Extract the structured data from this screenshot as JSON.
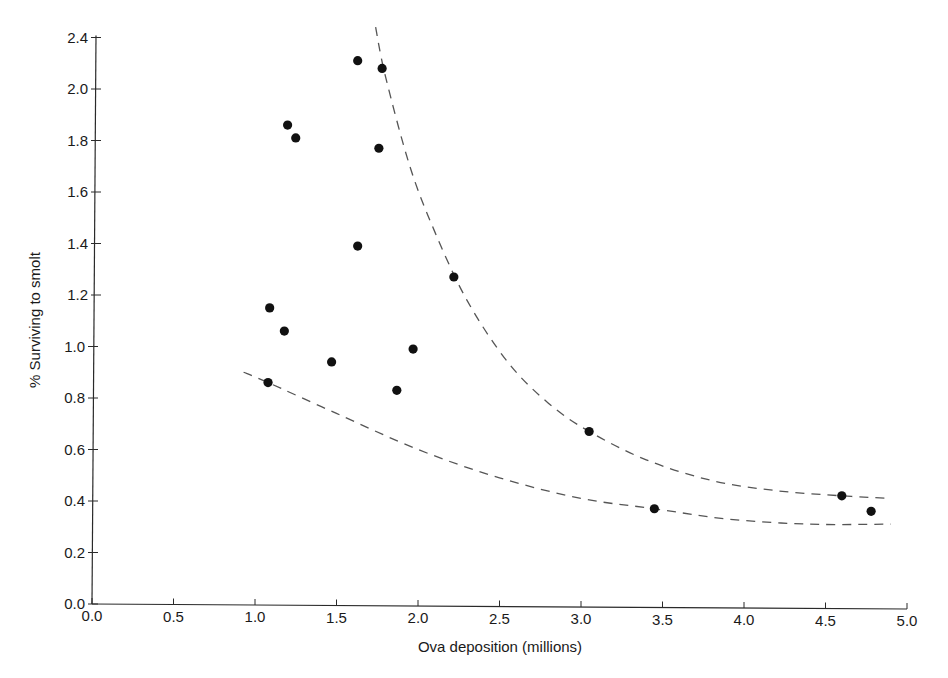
{
  "chart_data": {
    "type": "scatter",
    "title": "",
    "xlabel": "Ova deposition (millions)",
    "ylabel": "% Surviving to smolt",
    "xlim": [
      0.0,
      5.0
    ],
    "ylim": [
      0.0,
      2.2
    ],
    "x_ticks": [
      "0.0",
      "0.5",
      "1.0",
      "1.5",
      "2.0",
      "2.5",
      "3.0",
      "3.5",
      "4.0",
      "4.5",
      "5.0"
    ],
    "y_ticks": [
      {
        "value": 0.0,
        "label": "0.0"
      },
      {
        "value": 0.2,
        "label": "0.2"
      },
      {
        "value": 0.4,
        "label": "0.4"
      },
      {
        "value": 0.6,
        "label": "0.6"
      },
      {
        "value": 0.8,
        "label": "0.8"
      },
      {
        "value": 1.0,
        "label": "1.0"
      },
      {
        "value": 1.2,
        "label": "1.2"
      },
      {
        "value": 1.4,
        "label": "1.4"
      },
      {
        "value": 1.6,
        "label": "1.6"
      },
      {
        "value": 1.8,
        "label": "1.8"
      },
      {
        "value": 2.0,
        "label": "2.0"
      },
      {
        "value": 2.2,
        "label": "2.4"
      }
    ],
    "grid": false,
    "legend": null,
    "series": [
      {
        "name": "Observations",
        "marker": "filled-circle",
        "points": [
          {
            "x": 1.63,
            "y": 2.11
          },
          {
            "x": 1.78,
            "y": 2.08
          },
          {
            "x": 1.2,
            "y": 1.86
          },
          {
            "x": 1.25,
            "y": 1.81
          },
          {
            "x": 1.76,
            "y": 1.77
          },
          {
            "x": 1.63,
            "y": 1.39
          },
          {
            "x": 2.22,
            "y": 1.27
          },
          {
            "x": 1.09,
            "y": 1.15
          },
          {
            "x": 1.18,
            "y": 1.06
          },
          {
            "x": 1.97,
            "y": 0.99
          },
          {
            "x": 1.47,
            "y": 0.94
          },
          {
            "x": 1.08,
            "y": 0.86
          },
          {
            "x": 1.87,
            "y": 0.83
          },
          {
            "x": 3.05,
            "y": 0.67
          },
          {
            "x": 3.45,
            "y": 0.37
          },
          {
            "x": 4.6,
            "y": 0.42
          },
          {
            "x": 4.78,
            "y": 0.36
          }
        ]
      },
      {
        "name": "Upper bound curve",
        "style": "dashed",
        "points": [
          {
            "x": 1.74,
            "y": 2.24
          },
          {
            "x": 1.8,
            "y": 2.05
          },
          {
            "x": 1.95,
            "y": 1.7
          },
          {
            "x": 2.1,
            "y": 1.45
          },
          {
            "x": 2.3,
            "y": 1.18
          },
          {
            "x": 2.55,
            "y": 0.94
          },
          {
            "x": 2.8,
            "y": 0.78
          },
          {
            "x": 3.05,
            "y": 0.67
          },
          {
            "x": 3.4,
            "y": 0.56
          },
          {
            "x": 3.8,
            "y": 0.48
          },
          {
            "x": 4.2,
            "y": 0.44
          },
          {
            "x": 4.6,
            "y": 0.42
          },
          {
            "x": 4.9,
            "y": 0.41
          }
        ]
      },
      {
        "name": "Lower bound curve",
        "style": "dashed",
        "points": [
          {
            "x": 0.93,
            "y": 0.9
          },
          {
            "x": 1.08,
            "y": 0.86
          },
          {
            "x": 1.5,
            "y": 0.74
          },
          {
            "x": 2.0,
            "y": 0.6
          },
          {
            "x": 2.5,
            "y": 0.49
          },
          {
            "x": 3.0,
            "y": 0.41
          },
          {
            "x": 3.45,
            "y": 0.37
          },
          {
            "x": 3.9,
            "y": 0.33
          },
          {
            "x": 4.4,
            "y": 0.31
          },
          {
            "x": 4.9,
            "y": 0.31
          }
        ]
      }
    ]
  },
  "caption_fragment": "F i g u r e   1 0 . 3   S u r v i v a l   o f   o v a   t o   s m o l t"
}
